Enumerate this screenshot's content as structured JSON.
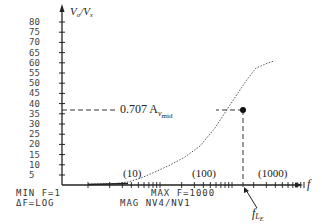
{
  "chart_data": {
    "type": "line",
    "title": "",
    "xlabel": "f",
    "ylabel": "Vo/Vs",
    "x_scale": "log",
    "xlim": [
      1,
      1000
    ],
    "ylim": [
      0,
      80
    ],
    "y_ticks": [
      "80",
      "75",
      "70",
      "65",
      "60",
      "55",
      "50",
      "45",
      "40",
      "35",
      "30",
      "25",
      "20",
      "15",
      "10",
      "5"
    ],
    "x_decade_labels": [
      "(10)",
      "(100)",
      "(1000)"
    ],
    "series": [
      {
        "name": "MAG NV4/NV1",
        "style": "dotted",
        "x": [
          3,
          10,
          20,
          50,
          100,
          200,
          400,
          500,
          800
        ],
        "y": [
          1,
          2,
          5,
          10,
          18,
          26,
          36,
          44,
          48
        ]
      }
    ],
    "annotations": {
      "level_label": "0.707 A",
      "level_sub": "v",
      "level_sub2": "mid",
      "level_value": 35,
      "corner_freq_label": "f",
      "corner_freq_sub": "L",
      "corner_freq_sub2": "E",
      "corner_freq_x": 400
    },
    "grid": false,
    "legend": "none"
  },
  "footer": {
    "min_f": "MIN  F=1",
    "delta_f": "ΔF=LOG",
    "max_f": "MAX  F=1000",
    "mag": "MAG  NV4/NV1"
  },
  "axes": {
    "y_label_main": "V",
    "y_label_sub1": "o",
    "y_label_slash": "/V",
    "y_label_sub2": "s",
    "x_label": "f"
  }
}
